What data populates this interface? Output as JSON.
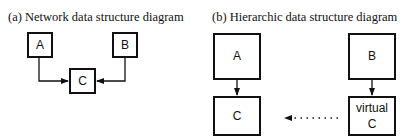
{
  "panels": [
    {
      "title": "(a)  Network data structure diagram",
      "nodes": {
        "a": "A",
        "b": "B",
        "c": "C"
      }
    },
    {
      "title": "(b)  Hierarchic data structure diagram",
      "nodes": {
        "a": "A",
        "b": "B",
        "c": "C",
        "virtual_c_line1": "virtual",
        "virtual_c_line2": "C"
      }
    }
  ]
}
